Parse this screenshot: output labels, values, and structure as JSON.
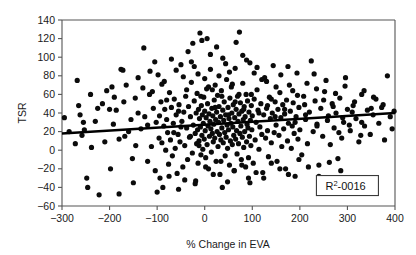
{
  "chart_data": {
    "type": "scatter",
    "title": "",
    "xlabel": "% Change in EVA",
    "ylabel": "TSR",
    "xlim": [
      -300,
      400
    ],
    "ylim": [
      -60,
      140
    ],
    "xticks": [
      -300,
      -200,
      -100,
      0,
      100,
      200,
      300,
      400
    ],
    "yticks": [
      -60,
      -40,
      -20,
      0,
      20,
      40,
      60,
      80,
      100,
      120,
      140
    ],
    "xtick_labels": [
      "-300",
      "-200",
      "-100",
      "0",
      "100",
      "200",
      "300",
      "400"
    ],
    "ytick_labels": [
      "-60",
      "-40",
      "-20",
      "0",
      "20",
      "40",
      "60",
      "80",
      "100",
      "120",
      "140"
    ],
    "grid": false,
    "legend": null,
    "marker": {
      "shape": "circle",
      "color": "#0b0b0b",
      "size": 2.6
    },
    "annotations": [
      {
        "name": "r-squared-box",
        "text": "R2-0016",
        "display_prefix": "R",
        "display_superscript": "2",
        "display_suffix": "-0016",
        "x": 300,
        "y": -38,
        "boxed": true
      }
    ],
    "trendline": {
      "type": "linear",
      "color": "#000000",
      "x_start": -300,
      "y_start": 18,
      "x_end": 400,
      "y_end": 40,
      "slope": 0.0314,
      "intercept": 27.4
    },
    "points": [
      [
        -295,
        35
      ],
      [
        -272,
        7
      ],
      [
        -268,
        75
      ],
      [
        -262,
        38
      ],
      [
        -258,
        16
      ],
      [
        -253,
        22
      ],
      [
        -248,
        -30
      ],
      [
        -246,
        -40
      ],
      [
        -238,
        3
      ],
      [
        -222,
        -48
      ],
      [
        -215,
        50
      ],
      [
        -206,
        64
      ],
      [
        -198,
        -20
      ],
      [
        -192,
        28
      ],
      [
        -186,
        43
      ],
      [
        -180,
        -47
      ],
      [
        -176,
        87
      ],
      [
        -172,
        86
      ],
      [
        -168,
        15
      ],
      [
        -160,
        20
      ],
      [
        -152,
        -9
      ],
      [
        -146,
        56
      ],
      [
        -140,
        40
      ],
      [
        -134,
        23
      ],
      [
        -128,
        110
      ],
      [
        -126,
        36
      ],
      [
        -120,
        -12
      ],
      [
        -116,
        60
      ],
      [
        -112,
        4
      ],
      [
        -108,
        45
      ],
      [
        -104,
        -22
      ],
      [
        -102,
        30
      ],
      [
        -98,
        81
      ],
      [
        -96,
        13
      ],
      [
        -94,
        -30
      ],
      [
        -92,
        52
      ],
      [
        -90,
        8
      ],
      [
        -88,
        -40
      ],
      [
        -86,
        26
      ],
      [
        -84,
        44
      ],
      [
        -82,
        0
      ],
      [
        -80,
        33
      ],
      [
        -78,
        19
      ],
      [
        -76,
        -15
      ],
      [
        -74,
        62
      ],
      [
        -72,
        11
      ],
      [
        -70,
        46
      ],
      [
        -68,
        -6
      ],
      [
        -66,
        29
      ],
      [
        -64,
        55
      ],
      [
        -62,
        2
      ],
      [
        -60,
        38
      ],
      [
        -58,
        -25
      ],
      [
        -56,
        17
      ],
      [
        -54,
        49
      ],
      [
        -52,
        9
      ],
      [
        -50,
        92
      ],
      [
        -48,
        31
      ],
      [
        -46,
        -18
      ],
      [
        -44,
        41
      ],
      [
        -42,
        5
      ],
      [
        -40,
        58
      ],
      [
        -38,
        24
      ],
      [
        -36,
        -10
      ],
      [
        -34,
        47
      ],
      [
        -32,
        14
      ],
      [
        -30,
        36
      ],
      [
        -28,
        95
      ],
      [
        -26,
        -3
      ],
      [
        -24,
        27
      ],
      [
        -22,
        53
      ],
      [
        -20,
        18
      ],
      [
        -19,
        -33
      ],
      [
        -18,
        40
      ],
      [
        -17,
        7
      ],
      [
        -16,
        61
      ],
      [
        -15,
        22
      ],
      [
        -14,
        -14
      ],
      [
        -13,
        44
      ],
      [
        -12,
        10
      ],
      [
        -11,
        34
      ],
      [
        -10,
        126
      ],
      [
        -9,
        25
      ],
      [
        -8,
        -5
      ],
      [
        -7,
        48
      ],
      [
        -6,
        16
      ],
      [
        -5,
        38
      ],
      [
        -4,
        1
      ],
      [
        -3,
        29
      ],
      [
        -2,
        57
      ],
      [
        -1,
        12
      ],
      [
        0,
        42
      ],
      [
        1,
        21
      ],
      [
        2,
        -8
      ],
      [
        3,
        35
      ],
      [
        4,
        66
      ],
      [
        5,
        6
      ],
      [
        6,
        50
      ],
      [
        7,
        26
      ],
      [
        8,
        -20
      ],
      [
        9,
        39
      ],
      [
        10,
        15
      ],
      [
        11,
        31
      ],
      [
        12,
        103
      ],
      [
        13,
        23
      ],
      [
        14,
        -2
      ],
      [
        15,
        45
      ],
      [
        16,
        18
      ],
      [
        17,
        37
      ],
      [
        18,
        9
      ],
      [
        19,
        28
      ],
      [
        20,
        54
      ],
      [
        21,
        13
      ],
      [
        22,
        70
      ],
      [
        23,
        33
      ],
      [
        24,
        -12
      ],
      [
        25,
        41
      ],
      [
        26,
        20
      ],
      [
        27,
        59
      ],
      [
        28,
        4
      ],
      [
        29,
        30
      ],
      [
        30,
        47
      ],
      [
        31,
        17
      ],
      [
        32,
        -26
      ],
      [
        33,
        36
      ],
      [
        34,
        11
      ],
      [
        35,
        64
      ],
      [
        36,
        24
      ],
      [
        37,
        -40
      ],
      [
        38,
        43
      ],
      [
        39,
        8
      ],
      [
        40,
        32
      ],
      [
        41,
        52
      ],
      [
        42,
        19
      ],
      [
        43,
        -6
      ],
      [
        44,
        38
      ],
      [
        45,
        14
      ],
      [
        46,
        76
      ],
      [
        47,
        27
      ],
      [
        48,
        2
      ],
      [
        49,
        46
      ],
      [
        50,
        22
      ],
      [
        51,
        34
      ],
      [
        52,
        -16
      ],
      [
        53,
        56
      ],
      [
        54,
        10
      ],
      [
        55,
        29
      ],
      [
        56,
        68
      ],
      [
        57,
        40
      ],
      [
        58,
        6
      ],
      [
        59,
        25
      ],
      [
        60,
        49
      ],
      [
        61,
        16
      ],
      [
        62,
        -22
      ],
      [
        63,
        35
      ],
      [
        64,
        88
      ],
      [
        65,
        12
      ],
      [
        66,
        44
      ],
      [
        67,
        21
      ],
      [
        68,
        -4
      ],
      [
        69,
        58
      ],
      [
        70,
        31
      ],
      [
        71,
        7
      ],
      [
        72,
        39
      ],
      [
        73,
        127
      ],
      [
        74,
        18
      ],
      [
        75,
        51
      ],
      [
        76,
        26
      ],
      [
        77,
        -10
      ],
      [
        78,
        42
      ],
      [
        79,
        14
      ],
      [
        80,
        72
      ],
      [
        81,
        33
      ],
      [
        82,
        3
      ],
      [
        83,
        47
      ],
      [
        84,
        20
      ],
      [
        85,
        36
      ],
      [
        86,
        -18
      ],
      [
        87,
        60
      ],
      [
        88,
        9
      ],
      [
        89,
        28
      ],
      [
        90,
        53
      ],
      [
        91,
        24
      ],
      [
        92,
        -30
      ],
      [
        93,
        41
      ],
      [
        94,
        15
      ],
      [
        95,
        94
      ],
      [
        96,
        32
      ],
      [
        97,
        5
      ],
      [
        98,
        48
      ],
      [
        99,
        22
      ],
      [
        100,
        37
      ],
      [
        102,
        -14
      ],
      [
        104,
        55
      ],
      [
        106,
        11
      ],
      [
        108,
        30
      ],
      [
        110,
        65
      ],
      [
        112,
        43
      ],
      [
        114,
        1
      ],
      [
        116,
        25
      ],
      [
        118,
        50
      ],
      [
        120,
        17
      ],
      [
        122,
        -24
      ],
      [
        124,
        38
      ],
      [
        126,
        78
      ],
      [
        128,
        13
      ],
      [
        130,
        45
      ],
      [
        132,
        21
      ],
      [
        134,
        -7
      ],
      [
        136,
        57
      ],
      [
        138,
        34
      ],
      [
        140,
        8
      ],
      [
        142,
        40
      ],
      [
        144,
        91
      ],
      [
        146,
        19
      ],
      [
        148,
        52
      ],
      [
        150,
        27
      ],
      [
        152,
        -12
      ],
      [
        154,
        44
      ],
      [
        156,
        16
      ],
      [
        158,
        62
      ],
      [
        160,
        35
      ],
      [
        162,
        4
      ],
      [
        164,
        49
      ],
      [
        166,
        23
      ],
      [
        168,
        39
      ],
      [
        170,
        -20
      ],
      [
        172,
        54
      ],
      [
        174,
        10
      ],
      [
        176,
        29
      ],
      [
        178,
        70
      ],
      [
        180,
        42
      ],
      [
        182,
        2
      ],
      [
        184,
        26
      ],
      [
        186,
        51
      ],
      [
        188,
        18
      ],
      [
        190,
        -28
      ],
      [
        192,
        36
      ],
      [
        194,
        83
      ],
      [
        196,
        12
      ],
      [
        198,
        46
      ],
      [
        200,
        22
      ],
      [
        204,
        -5
      ],
      [
        208,
        58
      ],
      [
        212,
        33
      ],
      [
        216,
        7
      ],
      [
        220,
        41
      ],
      [
        224,
        96
      ],
      [
        228,
        20
      ],
      [
        232,
        53
      ],
      [
        236,
        28
      ],
      [
        240,
        -16
      ],
      [
        244,
        45
      ],
      [
        248,
        15
      ],
      [
        252,
        63
      ],
      [
        256,
        -38
      ],
      [
        260,
        37
      ],
      [
        264,
        6
      ],
      [
        268,
        50
      ],
      [
        272,
        24
      ],
      [
        276,
        40
      ],
      [
        280,
        -9
      ],
      [
        284,
        56
      ],
      [
        288,
        13
      ],
      [
        292,
        30
      ],
      [
        296,
        78
      ],
      [
        300,
        44
      ],
      [
        306,
        21
      ],
      [
        312,
        48
      ],
      [
        318,
        34
      ],
      [
        324,
        9
      ],
      [
        330,
        60
      ],
      [
        336,
        26
      ],
      [
        342,
        43
      ],
      [
        348,
        17
      ],
      [
        354,
        38
      ],
      [
        360,
        55
      ],
      [
        366,
        29
      ],
      [
        372,
        46
      ],
      [
        378,
        11
      ],
      [
        384,
        80
      ],
      [
        390,
        36
      ],
      [
        394,
        23
      ],
      [
        398,
        42
      ],
      [
        -265,
        48
      ],
      [
        -230,
        31
      ],
      [
        -210,
        9
      ],
      [
        -190,
        57
      ],
      [
        -165,
        70
      ],
      [
        -150,
        -35
      ],
      [
        -130,
        67
      ],
      [
        -115,
        85
      ],
      [
        -100,
        -45
      ],
      [
        -85,
        74
      ],
      [
        -70,
        98
      ],
      [
        -55,
        -42
      ],
      [
        -45,
        79
      ],
      [
        -35,
        106
      ],
      [
        -25,
        115
      ],
      [
        -20,
        -36
      ],
      [
        -6,
        118
      ],
      [
        5,
        120
      ],
      [
        12,
        87
      ],
      [
        25,
        111
      ],
      [
        38,
        99
      ],
      [
        52,
        84
      ],
      [
        66,
        116
      ],
      [
        80,
        102
      ],
      [
        95,
        -35
      ],
      [
        110,
        89
      ],
      [
        130,
        74
      ],
      [
        150,
        68
      ],
      [
        175,
        90
      ],
      [
        195,
        59
      ],
      [
        215,
        72
      ],
      [
        235,
        66
      ],
      [
        255,
        75
      ],
      [
        275,
        61
      ],
      [
        295,
        69
      ],
      [
        315,
        52
      ],
      [
        335,
        64
      ],
      [
        355,
        57
      ],
      [
        375,
        49
      ],
      [
        -240,
        60
      ],
      [
        -180,
        12
      ],
      [
        -145,
        5
      ],
      [
        -110,
        63
      ],
      [
        -90,
        71
      ],
      [
        -75,
        -28
      ],
      [
        -60,
        86
      ],
      [
        -42,
        -32
      ],
      [
        -28,
        73
      ],
      [
        -14,
        82
      ],
      [
        0,
        77
      ],
      [
        16,
        65
      ],
      [
        30,
        80
      ],
      [
        44,
        93
      ],
      [
        58,
        71
      ],
      [
        72,
        60
      ],
      [
        88,
        97
      ],
      [
        104,
        83
      ],
      [
        120,
        76
      ],
      [
        140,
        55
      ],
      [
        160,
        81
      ],
      [
        185,
        64
      ],
      [
        210,
        49
      ],
      [
        230,
        82
      ],
      [
        250,
        54
      ],
      [
        270,
        47
      ],
      [
        290,
        35
      ],
      [
        310,
        41
      ],
      [
        330,
        30
      ],
      [
        350,
        45
      ],
      [
        -200,
        44
      ],
      [
        -155,
        33
      ],
      [
        -120,
        27
      ],
      [
        -95,
        37
      ],
      [
        -65,
        19
      ],
      [
        -50,
        25
      ],
      [
        -30,
        15
      ],
      [
        -12,
        5
      ],
      [
        2,
        -18
      ],
      [
        18,
        -26
      ],
      [
        34,
        -12
      ],
      [
        48,
        -34
      ],
      [
        62,
        -22
      ],
      [
        78,
        -16
      ],
      [
        92,
        -8
      ],
      [
        108,
        -24
      ],
      [
        124,
        -30
      ],
      [
        140,
        -14
      ],
      [
        158,
        -20
      ],
      [
        176,
        -26
      ],
      [
        198,
        -10
      ],
      [
        218,
        -18
      ],
      [
        240,
        -28
      ],
      [
        262,
        -13
      ],
      [
        286,
        -22
      ],
      [
        -285,
        20
      ],
      [
        -255,
        30
      ],
      [
        -225,
        45
      ],
      [
        -195,
        68
      ],
      [
        -170,
        52
      ],
      [
        -140,
        78
      ],
      [
        -105,
        95
      ],
      [
        -80,
        54
      ],
      [
        -55,
        42
      ],
      [
        -38,
        65
      ],
      [
        -22,
        90
      ],
      [
        -8,
        58
      ],
      [
        8,
        68
      ],
      [
        22,
        46
      ],
      [
        36,
        58
      ],
      [
        50,
        38
      ],
      [
        64,
        52
      ],
      [
        82,
        44
      ],
      [
        98,
        60
      ],
      [
        114,
        40
      ],
      [
        132,
        48
      ],
      [
        148,
        36
      ],
      [
        168,
        44
      ],
      [
        190,
        30
      ],
      [
        212,
        38
      ],
      [
        236,
        26
      ],
      [
        258,
        32
      ],
      [
        282,
        19
      ],
      [
        304,
        27
      ],
      [
        328,
        16
      ]
    ]
  },
  "figure": {
    "background": "#ffffff",
    "axis_color": "#555555",
    "point_color": "#0b0b0b",
    "line_color": "#000000"
  }
}
